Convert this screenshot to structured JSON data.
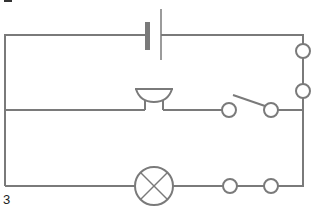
{
  "diagram": {
    "type": "circuit",
    "figure_label": "3",
    "wire_color": "#7a7a7a",
    "components": [
      {
        "id": "battery",
        "kind": "cell",
        "position": "top"
      },
      {
        "id": "terminal-right-1",
        "kind": "terminal",
        "position": "right"
      },
      {
        "id": "terminal-right-2",
        "kind": "terminal",
        "position": "right"
      },
      {
        "id": "buzzer",
        "kind": "buzzer",
        "position": "middle"
      },
      {
        "id": "switch",
        "kind": "open-switch",
        "position": "middle"
      },
      {
        "id": "lamp",
        "kind": "lamp",
        "position": "bottom"
      },
      {
        "id": "terminal-bottom-1",
        "kind": "terminal",
        "position": "bottom"
      },
      {
        "id": "terminal-bottom-2",
        "kind": "terminal",
        "position": "bottom"
      }
    ]
  }
}
